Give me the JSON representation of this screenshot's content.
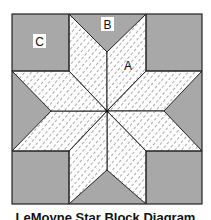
{
  "diagram": {
    "title": "LeMoyne Star Block Diagram",
    "caption": "LeMoyne Star Block Diagram",
    "labels": {
      "diamond": "A",
      "triangle": "B",
      "corner_square": "C"
    },
    "colors": {
      "background_fabric": "#a8a8a8",
      "star_fabric": "#ffffff",
      "hatch": "#555555",
      "outline": "#222222",
      "label_box": "#ffffff"
    },
    "pieces": {
      "diamonds": 8,
      "triangles": 4,
      "corner_squares": 4
    }
  }
}
